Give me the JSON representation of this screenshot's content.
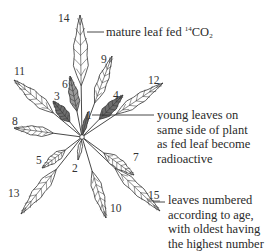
{
  "diagram": {
    "center": {
      "x": 82,
      "y": 137
    },
    "colors": {
      "line": "#333333",
      "leaf_fill": "#ffffff",
      "radioactive_fill": "#6e6e6e",
      "radioactive_fill_light": "#9a9a9a"
    },
    "leaves": [
      {
        "number": "14",
        "tip": [
          80,
          15
        ],
        "width": 17,
        "radioactive": false,
        "label_pos": [
          58,
          22
        ]
      },
      {
        "number": "9",
        "tip": [
          112,
          56
        ],
        "width": 12,
        "radioactive": false,
        "label_pos": [
          101,
          63
        ]
      },
      {
        "number": "12",
        "tip": [
          163,
          83
        ],
        "width": 12,
        "radioactive": false,
        "label_pos": [
          148,
          84
        ]
      },
      {
        "number": "11",
        "tip": [
          14,
          80
        ],
        "width": 13,
        "radioactive": false,
        "label_pos": [
          14,
          75
        ]
      },
      {
        "number": "8",
        "tip": [
          14,
          128
        ],
        "width": 11,
        "radioactive": false,
        "label_pos": [
          12,
          125
        ]
      },
      {
        "number": "6",
        "tip": [
          70,
          76
        ],
        "width": 11,
        "radioactive": true,
        "label_pos": [
          62,
          88
        ]
      },
      {
        "number": "3",
        "tip": [
          53,
          101
        ],
        "width": 12,
        "radioactive": true,
        "label_pos": [
          54,
          100
        ]
      },
      {
        "number": "4",
        "tip": [
          123,
          95
        ],
        "width": 12,
        "radioactive": true,
        "label_pos": [
          113,
          99
        ]
      },
      {
        "number": "1",
        "tip": [
          88,
          112
        ],
        "width": 5,
        "radioactive": true,
        "label_pos": [
          86,
          119
        ]
      },
      {
        "number": "5",
        "tip": [
          42,
          168
        ],
        "width": 10,
        "radioactive": false,
        "label_pos": [
          36,
          164
        ]
      },
      {
        "number": "2",
        "tip": [
          78,
          160
        ],
        "width": 5,
        "radioactive": false,
        "label_pos": [
          72,
          172
        ]
      },
      {
        "number": "13",
        "tip": [
          21,
          214
        ],
        "width": 13,
        "radioactive": false,
        "label_pos": [
          8,
          197
        ]
      },
      {
        "number": "10",
        "tip": [
          106,
          218
        ],
        "width": 12,
        "radioactive": false,
        "label_pos": [
          110,
          212
        ]
      },
      {
        "number": "7",
        "tip": [
          134,
          175
        ],
        "width": 12,
        "radioactive": false,
        "label_pos": [
          133,
          161
        ]
      },
      {
        "number": "15",
        "tip": [
          160,
          211
        ],
        "width": 12,
        "radioactive": false,
        "label_pos": [
          148,
          199
        ]
      }
    ],
    "annotations": {
      "fed_leaf": {
        "text_main": "mature leaf fed ",
        "isotope_sup": "14",
        "molecule": "CO",
        "molecule_sub": "2"
      },
      "young_leaves": {
        "lines": [
          "young leaves on",
          "same side of plant",
          "as fed leaf become",
          "radioactive"
        ]
      },
      "numbering": {
        "lines": [
          "leaves numbered",
          "according to age,",
          "with oldest having",
          "the highest number"
        ]
      }
    }
  }
}
